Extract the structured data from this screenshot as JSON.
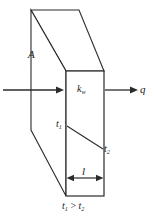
{
  "figure": {
    "stroke_color": "#2b2b2b",
    "fill_color": "#ffffff",
    "labels": {
      "area": "A",
      "conductivity_symbol": "k",
      "conductivity_subscript": "w",
      "heat_flux": "q",
      "temp_hot_symbol": "t",
      "temp_hot_subscript": "1",
      "temp_cold_symbol": "t",
      "temp_cold_subscript": "2",
      "thickness": "l",
      "condition_lhs_symbol": "t",
      "condition_lhs_subscript": "1",
      "condition_operator": " > ",
      "condition_rhs_symbol": "t",
      "condition_rhs_subscript": "2"
    },
    "geometry": {
      "front_face": {
        "x": 66,
        "y": 71,
        "width": 38,
        "height": 125
      },
      "top_back_left": {
        "x": 31,
        "y": 10
      },
      "top_back_right": {
        "x": 79,
        "y": 10
      },
      "left_back_bottom": {
        "x": 31,
        "y": 130
      },
      "bottom_back_point": {
        "x": 66,
        "y": 196
      },
      "inlet_arrow": {
        "x1": 3,
        "y1": 90,
        "x2": 64,
        "y2": 90
      },
      "outlet_arrow": {
        "x1": 106,
        "y1": 90,
        "x2": 138,
        "y2": 90
      },
      "dimension_arrow": {
        "x1": 68,
        "y1": 178,
        "x2": 102,
        "y2": 178
      },
      "temperature_gradient_line": {
        "x1": 67,
        "y1": 126,
        "x2": 103,
        "y2": 149
      }
    }
  }
}
